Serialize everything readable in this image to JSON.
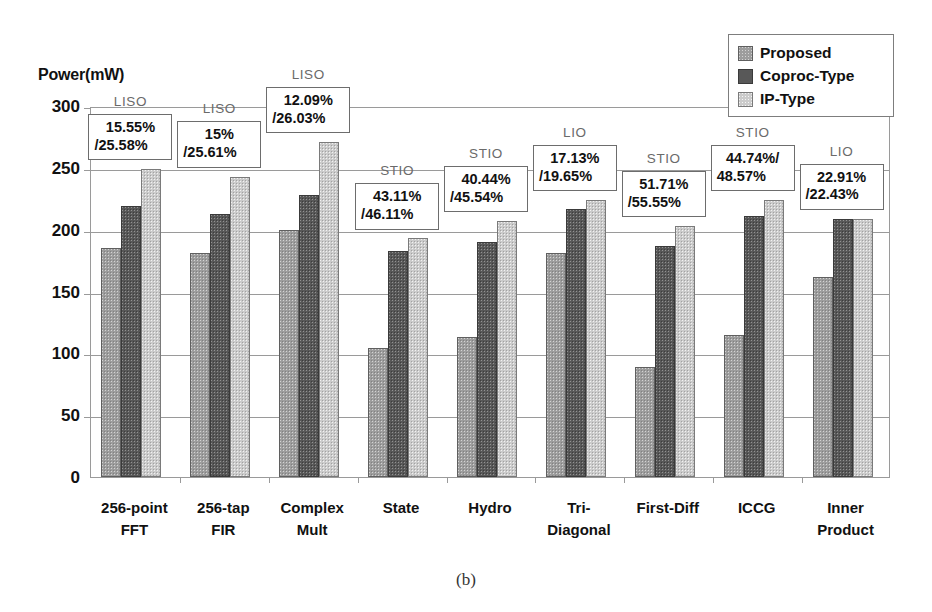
{
  "chart_data": {
    "type": "bar",
    "title": "",
    "xlabel": "",
    "ylabel": "Power(mW)",
    "ylim": [
      0,
      300
    ],
    "yticks": [
      "0",
      "50",
      "100",
      "150",
      "200",
      "250",
      "300"
    ],
    "grid": true,
    "legend_position": "top-right",
    "categories": [
      "256-point FFT",
      "256-tap FIR",
      "Complex Mult",
      "State",
      "Hydro",
      "Tri-Diagonal",
      "First-Diff",
      "ICCG",
      "Inner Product"
    ],
    "category_lines": [
      [
        "256-point",
        "FFT"
      ],
      [
        "256-tap",
        "FIR"
      ],
      [
        "Complex",
        "Mult"
      ],
      [
        "State",
        ""
      ],
      [
        "Hydro",
        ""
      ],
      [
        "Tri-",
        "Diagonal"
      ],
      [
        "First-Diff",
        ""
      ],
      [
        "ICCG",
        ""
      ],
      [
        "Inner",
        "Product"
      ]
    ],
    "series": [
      {
        "name": "Proposed",
        "color": "#9d9d9d",
        "values": [
          185,
          181,
          200,
          104,
          113,
          181,
          89,
          115,
          162
        ]
      },
      {
        "name": "Coproc-Type",
        "color": "#585858",
        "values": [
          219,
          213,
          228,
          183,
          190,
          217,
          187,
          211,
          209
        ]
      },
      {
        "name": "IP-Type",
        "color": "#cbcbcb",
        "values": [
          249,
          243,
          271,
          193,
          207,
          224,
          203,
          224,
          209
        ]
      }
    ],
    "annotations": [
      {
        "category": "256-point FFT",
        "io_type": "LISO",
        "line1": "15.55%",
        "line2": "/25.58%"
      },
      {
        "category": "256-tap FIR",
        "io_type": "LISO",
        "line1": "15%",
        "line2": "/25.61%"
      },
      {
        "category": "Complex Mult",
        "io_type": "LISO",
        "line1": "12.09%",
        "line2": "/26.03%"
      },
      {
        "category": "State",
        "io_type": "STIO",
        "line1": "43.11%",
        "line2": "/46.11%"
      },
      {
        "category": "Hydro",
        "io_type": "STIO",
        "line1": "40.44%",
        "line2": "/45.54%"
      },
      {
        "category": "Tri-Diagonal",
        "io_type": "LIO",
        "line1": "17.13%",
        "line2": "/19.65%"
      },
      {
        "category": "First-Diff",
        "io_type": "STIO",
        "line1": "51.71%",
        "line2": "/55.55%"
      },
      {
        "category": "ICCG",
        "io_type": "STIO",
        "line1": "44.74%/",
        "line2": "48.57%"
      },
      {
        "category": "Inner Product",
        "io_type": "LIO",
        "line1": "22.91%",
        "line2": "/22.43%"
      }
    ]
  },
  "axis": {
    "y_title": "Power(mW)"
  },
  "legend": {
    "items": [
      {
        "label": "Proposed"
      },
      {
        "label": "Coproc-Type"
      },
      {
        "label": "IP-Type"
      }
    ]
  },
  "caption": {
    "text": "(b)"
  }
}
